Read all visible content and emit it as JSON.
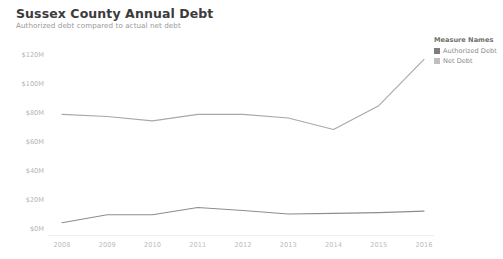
{
  "header": {
    "title": "Sussex County Annual Debt",
    "subtitle": "Authorized debt compared to actual net debt"
  },
  "legend": {
    "title": "Measure Names",
    "items": [
      {
        "label": "Authorized Debt",
        "color": "#7d7d7d"
      },
      {
        "label": "Net Debt",
        "color": "#bfbfbf"
      }
    ]
  },
  "axes": {
    "y_ticks": [
      "$0M",
      "$20M",
      "$40M",
      "$60M",
      "$80M",
      "$100M",
      "$120M"
    ],
    "x_ticks": [
      "2008",
      "2009",
      "2010",
      "2011",
      "2012",
      "2013",
      "2014",
      "2015",
      "2016"
    ]
  },
  "chart_data": {
    "type": "line",
    "title": "Sussex County Annual Debt",
    "subtitle": "Authorized debt compared to actual net debt",
    "xlabel": "",
    "ylabel": "",
    "categories": [
      "2008",
      "2009",
      "2010",
      "2011",
      "2012",
      "2013",
      "2014",
      "2015",
      "2016"
    ],
    "x": [
      2008,
      2009,
      2010,
      2011,
      2012,
      2013,
      2014,
      2015,
      2016
    ],
    "series": [
      {
        "name": "Authorized Debt",
        "color": "#a8a8a8",
        "values": [
          79.0,
          77.5,
          74.5,
          79.0,
          79.0,
          76.5,
          68.5,
          85.0,
          117.0
        ]
      },
      {
        "name": "Net Debt",
        "color": "#8d8d8d",
        "values": [
          4.0,
          9.5,
          9.5,
          14.5,
          12.5,
          10.0,
          10.5,
          11.0,
          12.0
        ]
      }
    ],
    "ylim": [
      0,
      130
    ],
    "yunit": "$M",
    "ytick_values": [
      0,
      20,
      40,
      60,
      80,
      100,
      120
    ],
    "grid": false,
    "legend_position": "right"
  }
}
